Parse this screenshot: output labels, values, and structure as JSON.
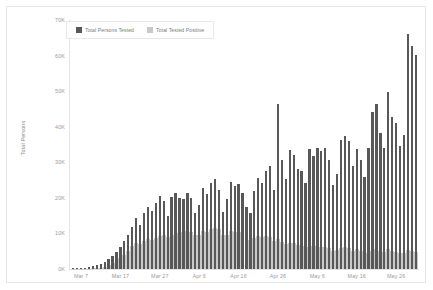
{
  "chart_data": {
    "type": "bar",
    "title": "",
    "xlabel": "",
    "ylabel": "Total Persons",
    "ylim": [
      0,
      70000
    ],
    "ytick_labels": [
      "0K",
      "10K",
      "20K",
      "30K",
      "40K",
      "50K",
      "60K",
      "70K"
    ],
    "ytick_values": [
      0,
      10000,
      20000,
      30000,
      40000,
      50000,
      60000,
      70000
    ],
    "xtick_labels": [
      "Mar 7",
      "Mar 17",
      "Mar 27",
      "Apr 6",
      "Apr 16",
      "Apr 26",
      "May 6",
      "May 16",
      "May 26"
    ],
    "xtick_dates": [
      "2020-03-07",
      "2020-03-17",
      "2020-03-27",
      "2020-04-06",
      "2020-04-16",
      "2020-04-26",
      "2020-05-06",
      "2020-05-16",
      "2020-05-26"
    ],
    "grid": false,
    "legend_position": "top-left",
    "bar_overlay": true,
    "series": [
      {
        "name": "Total Persons Tested",
        "color": "#585858",
        "x": [
          "2020-03-05",
          "2020-03-06",
          "2020-03-07",
          "2020-03-08",
          "2020-03-09",
          "2020-03-10",
          "2020-03-11",
          "2020-03-12",
          "2020-03-13",
          "2020-03-14",
          "2020-03-15",
          "2020-03-16",
          "2020-03-17",
          "2020-03-18",
          "2020-03-19",
          "2020-03-20",
          "2020-03-21",
          "2020-03-22",
          "2020-03-23",
          "2020-03-24",
          "2020-03-25",
          "2020-03-26",
          "2020-03-27",
          "2020-03-28",
          "2020-03-29",
          "2020-03-30",
          "2020-03-31",
          "2020-04-01",
          "2020-04-02",
          "2020-04-03",
          "2020-04-04",
          "2020-04-05",
          "2020-04-06",
          "2020-04-07",
          "2020-04-08",
          "2020-04-09",
          "2020-04-10",
          "2020-04-11",
          "2020-04-12",
          "2020-04-13",
          "2020-04-14",
          "2020-04-15",
          "2020-04-16",
          "2020-04-17",
          "2020-04-18",
          "2020-04-19",
          "2020-04-20",
          "2020-04-21",
          "2020-04-22",
          "2020-04-23",
          "2020-04-24",
          "2020-04-25",
          "2020-04-26",
          "2020-04-27",
          "2020-04-28",
          "2020-04-29",
          "2020-04-30",
          "2020-05-01",
          "2020-05-02",
          "2020-05-03",
          "2020-05-04",
          "2020-05-05",
          "2020-05-06",
          "2020-05-07",
          "2020-05-08",
          "2020-05-09",
          "2020-05-10",
          "2020-05-11",
          "2020-05-12",
          "2020-05-13",
          "2020-05-14",
          "2020-05-15",
          "2020-05-16",
          "2020-05-17",
          "2020-05-18",
          "2020-05-19",
          "2020-05-20",
          "2020-05-21",
          "2020-05-22",
          "2020-05-23",
          "2020-05-24",
          "2020-05-25",
          "2020-05-26",
          "2020-05-27",
          "2020-05-28",
          "2020-05-29",
          "2020-05-30",
          "2020-05-31"
        ],
        "values": [
          180,
          230,
          320,
          420,
          560,
          760,
          1050,
          1450,
          2000,
          2700,
          3600,
          4700,
          6200,
          7800,
          9500,
          11800,
          14300,
          12500,
          15800,
          17500,
          16200,
          18500,
          20500,
          19000,
          14800,
          20200,
          21500,
          20000,
          19600,
          21300,
          20100,
          15800,
          17900,
          22800,
          21200,
          24300,
          25400,
          22100,
          15900,
          19700,
          24600,
          23200,
          23900,
          21500,
          17500,
          15800,
          21800,
          25500,
          24300,
          27600,
          28900,
          22100,
          46400,
          30700,
          25400,
          33400,
          32000,
          28100,
          27600,
          24300,
          33600,
          31900,
          34000,
          33100,
          33900,
          30600,
          23500,
          26700,
          36200,
          37500,
          35900,
          28900,
          33800,
          30600,
          25900,
          34100,
          44200,
          46300,
          38200,
          33900,
          49700,
          42800,
          41100,
          34500,
          37600,
          66100,
          62700,
          60300
        ]
      },
      {
        "name": "Total Tested Positive",
        "color": "#c9c9c9",
        "x": [
          "2020-03-05",
          "2020-03-06",
          "2020-03-07",
          "2020-03-08",
          "2020-03-09",
          "2020-03-10",
          "2020-03-11",
          "2020-03-12",
          "2020-03-13",
          "2020-03-14",
          "2020-03-15",
          "2020-03-16",
          "2020-03-17",
          "2020-03-18",
          "2020-03-19",
          "2020-03-20",
          "2020-03-21",
          "2020-03-22",
          "2020-03-23",
          "2020-03-24",
          "2020-03-25",
          "2020-03-26",
          "2020-03-27",
          "2020-03-28",
          "2020-03-29",
          "2020-03-30",
          "2020-03-31",
          "2020-04-01",
          "2020-04-02",
          "2020-04-03",
          "2020-04-04",
          "2020-04-05",
          "2020-04-06",
          "2020-04-07",
          "2020-04-08",
          "2020-04-09",
          "2020-04-10",
          "2020-04-11",
          "2020-04-12",
          "2020-04-13",
          "2020-04-14",
          "2020-04-15",
          "2020-04-16",
          "2020-04-17",
          "2020-04-18",
          "2020-04-19",
          "2020-04-20",
          "2020-04-21",
          "2020-04-22",
          "2020-04-23",
          "2020-04-24",
          "2020-04-25",
          "2020-04-26",
          "2020-04-27",
          "2020-04-28",
          "2020-04-29",
          "2020-04-30",
          "2020-05-01",
          "2020-05-02",
          "2020-05-03",
          "2020-05-04",
          "2020-05-05",
          "2020-05-06",
          "2020-05-07",
          "2020-05-08",
          "2020-05-09",
          "2020-05-10",
          "2020-05-11",
          "2020-05-12",
          "2020-05-13",
          "2020-05-14",
          "2020-05-15",
          "2020-05-16",
          "2020-05-17",
          "2020-05-18",
          "2020-05-19",
          "2020-05-20",
          "2020-05-21",
          "2020-05-22",
          "2020-05-23",
          "2020-05-24",
          "2020-05-25",
          "2020-05-26",
          "2020-05-27",
          "2020-05-28",
          "2020-05-29",
          "2020-05-30",
          "2020-05-31"
        ],
        "values": [
          20,
          30,
          50,
          70,
          110,
          170,
          260,
          420,
          680,
          1050,
          1600,
          2300,
          3100,
          4000,
          5100,
          6400,
          7300,
          7100,
          7800,
          8300,
          8100,
          8800,
          9400,
          9600,
          8900,
          9700,
          10100,
          10000,
          10300,
          10600,
          10500,
          9600,
          9500,
          10700,
          10500,
          11300,
          11500,
          11200,
          9700,
          9600,
          10600,
          10300,
          10400,
          9800,
          8900,
          8100,
          8600,
          9200,
          8900,
          9200,
          9100,
          7900,
          8300,
          7600,
          7000,
          7400,
          7300,
          6800,
          6600,
          6200,
          6700,
          6400,
          6500,
          6300,
          6300,
          5900,
          5200,
          5400,
          6000,
          6100,
          5800,
          5200,
          5500,
          5100,
          4600,
          5100,
          5700,
          5700,
          5100,
          4700,
          5600,
          5100,
          4800,
          4400,
          4500,
          5400,
          5100,
          4900
        ]
      }
    ]
  },
  "legend": {
    "items": [
      {
        "label": "Total Persons Tested",
        "swatch": "#585858"
      },
      {
        "label": "Total Tested Positive",
        "swatch": "#c9c9c9"
      }
    ]
  },
  "axes": {
    "y_title": "Total Persons"
  }
}
